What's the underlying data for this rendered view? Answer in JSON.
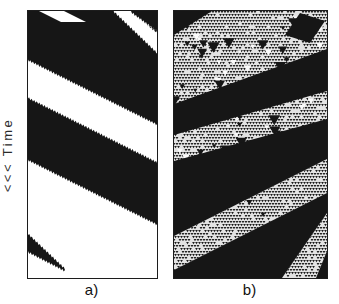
{
  "figure": {
    "axis_label": "<<< Time",
    "colors": {
      "ink": "#161616",
      "paper": "#ffffff",
      "mesh_bg": "#e3e3e3",
      "mesh_tri": "#1b1b1b",
      "label": "#2a2a2a"
    },
    "panel_a": {
      "label": "a)",
      "type": "space-time diagram, striped phase",
      "width": 129,
      "height": 267,
      "slope": 0.5,
      "tooth_pitch": 2.6,
      "tooth_height": 2.2,
      "bands": [
        {
          "t": -44,
          "b": 48
        },
        {
          "t": 88,
          "b": 148
        }
      ],
      "corner_wedge_white": [
        [
          103,
          0
        ],
        [
          131,
          22
        ],
        [
          131,
          45
        ],
        [
          84,
          0
        ]
      ],
      "corner_black": [
        [
          103,
          0
        ],
        [
          133,
          0
        ],
        [
          133,
          22
        ]
      ],
      "bottom_wedge": {
        "top_start": [
          0,
          224
        ],
        "bottom_start": [
          0,
          240
        ],
        "tip": [
          37,
          259
        ]
      },
      "sliver_white": [
        [
          11,
          0
        ],
        [
          36,
          0
        ],
        [
          58,
          11
        ],
        [
          33,
          11
        ]
      ]
    },
    "panel_b": {
      "label": "b)",
      "type": "space-time diagram, turbulent phase",
      "width": 153,
      "height": 267,
      "mesh_pitch": 3.0,
      "mesh_tri_size": 2.7,
      "mesh_skip": 0.13,
      "seed": 7,
      "white_triangles": 36,
      "black_triangles": 50,
      "corner_wedge": [
        [
          0,
          0
        ],
        [
          38,
          0
        ],
        [
          0,
          24
        ]
      ],
      "black_bands": [
        [
          [
            0,
            93
          ],
          [
            153,
            38
          ],
          [
            153,
            80
          ],
          [
            0,
            124
          ]
        ],
        [
          [
            0,
            150
          ],
          [
            153,
            108
          ],
          [
            153,
            267
          ],
          [
            0,
            267
          ]
        ],
        [
          [
            126,
            2
          ],
          [
            151,
            10
          ],
          [
            136,
            32
          ],
          [
            111,
            24
          ]
        ]
      ],
      "texture_stripes": [
        [
          [
            153,
            148
          ],
          [
            153,
            182
          ],
          [
            0,
            259
          ],
          [
            0,
            225
          ]
        ],
        [
          [
            153,
            202
          ],
          [
            153,
            240
          ],
          [
            142,
            267
          ],
          [
            108,
            267
          ]
        ]
      ]
    }
  }
}
